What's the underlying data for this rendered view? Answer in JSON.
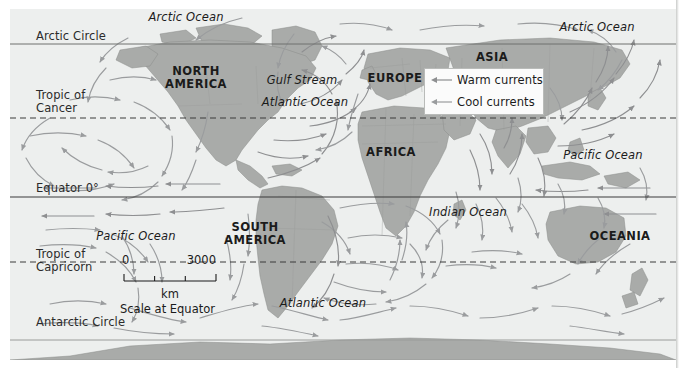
{
  "map": {
    "title": "World map of ocean currents",
    "colors": {
      "ocean": "#edefee",
      "land": "#a9aba9",
      "land_border": "#8d8f8d",
      "warm_current": "#8e8f91",
      "cool_current": "#9a9c9e",
      "latitude_line": "#6f716f",
      "text": "#1b1b1b",
      "background": "#ffffff"
    },
    "latitude_lines": [
      {
        "label": "Arctic Circle",
        "style": "solid",
        "y": 44
      },
      {
        "label": "Tropic of\nCancer",
        "style": "dashed",
        "y": 118
      },
      {
        "label": "Equator 0°",
        "style": "solid",
        "y": 197
      },
      {
        "label": "Tropic of\nCapricorn",
        "style": "dashed",
        "y": 262
      },
      {
        "label": "Antarctic Circle",
        "style": "solid",
        "y": 340
      }
    ],
    "continents": [
      {
        "label": "NORTH\nAMERICA",
        "x": 196,
        "y": 72
      },
      {
        "label": "SOUTH\nAMERICA",
        "x": 255,
        "y": 228
      },
      {
        "label": "EUROPE",
        "x": 395,
        "y": 78
      },
      {
        "label": "AFRICA",
        "x": 391,
        "y": 152
      },
      {
        "label": "ASIA",
        "x": 492,
        "y": 57
      },
      {
        "label": "OCEANIA",
        "x": 620,
        "y": 236
      }
    ],
    "oceans": [
      {
        "label": "Arctic Ocean",
        "x": 186,
        "y": 17
      },
      {
        "label": "Arctic Ocean",
        "x": 597,
        "y": 27
      },
      {
        "label": "Atlantic Ocean",
        "x": 305,
        "y": 102
      },
      {
        "label": "Atlantic Ocean",
        "x": 323,
        "y": 303
      },
      {
        "label": "Pacific Ocean",
        "x": 136,
        "y": 236
      },
      {
        "label": "Pacific Ocean",
        "x": 603,
        "y": 155
      },
      {
        "label": "Indian Ocean",
        "x": 468,
        "y": 212
      }
    ],
    "named_currents": [
      {
        "label": "Gulf Stream",
        "x": 302,
        "y": 80
      }
    ],
    "legend": {
      "items": [
        {
          "label": "Warm currents",
          "icon": "left-arrow-icon",
          "color": "#8e8f91"
        },
        {
          "label": "Cool currents",
          "icon": "left-arrow-icon",
          "color": "#9a9c9e"
        }
      ]
    },
    "scale": {
      "min": "0",
      "max": "3000",
      "unit": "km",
      "caption": "Scale at Equator"
    }
  }
}
